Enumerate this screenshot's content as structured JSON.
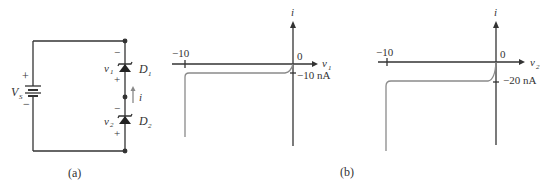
{
  "figure": {
    "panel_a": {
      "caption": "(a)",
      "source": {
        "label": "V",
        "subscript": "S",
        "plus": "+",
        "minus": "−"
      },
      "diode1": {
        "label": "D",
        "subscript": "1",
        "voltage_label": "v",
        "voltage_subscript": "1",
        "plus": "+",
        "minus": "−"
      },
      "diode2": {
        "label": "D",
        "subscript": "2",
        "voltage_label": "v",
        "voltage_subscript": "2",
        "plus": "+",
        "minus": "−"
      },
      "current_label": "i"
    },
    "panel_b": {
      "caption": "(b)",
      "graph1": {
        "y_axis_label": "i",
        "x_axis_label": "v",
        "x_axis_subscript": "1",
        "tick_left": "−10",
        "origin_label": "0",
        "saturation_label": "−10 nA"
      },
      "graph2": {
        "y_axis_label": "i",
        "x_axis_label": "v",
        "x_axis_subscript": "2",
        "tick_left": "−10",
        "origin_label": "0",
        "saturation_label": "−20 nA"
      }
    },
    "colors": {
      "line": "#333333",
      "curve": "#8a8a8a",
      "current_arrow": "#888888"
    }
  }
}
